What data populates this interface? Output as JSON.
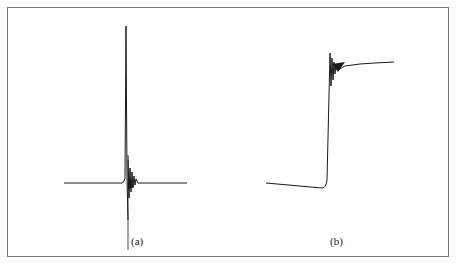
{
  "figure": {
    "panels": [
      {
        "id": "a",
        "label": "(a)",
        "description": "Sharp spike: flat baseline, tall narrow positive peak, then damped ringing and negative dip returning to baseline"
      },
      {
        "id": "b",
        "label": "(b)",
        "description": "Step response: slightly declining baseline, steep rise, overshoot with damped oscillation, then slow settling plateau"
      }
    ]
  },
  "colors": {
    "trace": "#1a1a1a",
    "border": "#777777",
    "background": "#ffffff"
  }
}
